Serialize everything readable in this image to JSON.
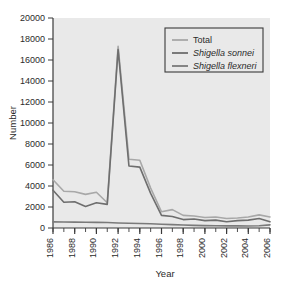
{
  "chart_data": {
    "type": "line",
    "title": "",
    "xlabel": "Year",
    "ylabel": "Number",
    "xlim": [
      1986,
      2006
    ],
    "ylim": [
      0,
      20000
    ],
    "grid": false,
    "legend_position": "top-right",
    "x": [
      1986,
      1987,
      1988,
      1989,
      1990,
      1991,
      1992,
      1993,
      1994,
      1995,
      1996,
      1997,
      1998,
      1999,
      2000,
      2001,
      2002,
      2003,
      2004,
      2005,
      2006
    ],
    "xticklabels": [
      "1986",
      "1988",
      "1990",
      "1992",
      "1994",
      "1996",
      "1998",
      "2000",
      "2002",
      "2004",
      "2006"
    ],
    "xtickvalues": [
      1986,
      1988,
      1990,
      1992,
      1994,
      1996,
      1998,
      2000,
      2002,
      2004,
      2006
    ],
    "yticklabels": [
      "0",
      "2000",
      "4000",
      "6000",
      "8000",
      "10000",
      "12000",
      "14000",
      "16000",
      "18000",
      "20000"
    ],
    "ytickvalues": [
      0,
      2000,
      4000,
      6000,
      8000,
      10000,
      12000,
      14000,
      16000,
      18000,
      20000
    ],
    "series": [
      {
        "name": "Total",
        "italic": false,
        "color": "#a8a8a8",
        "values": [
          4600,
          3500,
          3450,
          3200,
          3400,
          2400,
          17300,
          6550,
          6450,
          3800,
          1550,
          1750,
          1200,
          1150,
          1000,
          1050,
          900,
          950,
          1050,
          1250,
          1050
        ]
      },
      {
        "name": "Shigella sonnei",
        "italic": true,
        "color": "#6e6e6e",
        "values": [
          3600,
          2450,
          2500,
          2050,
          2400,
          2250,
          17000,
          5900,
          5800,
          3300,
          1200,
          1100,
          800,
          850,
          700,
          750,
          600,
          700,
          750,
          900,
          600
        ]
      },
      {
        "name": "Shigella flexneri",
        "italic": true,
        "color": "#7a7a7a",
        "values": [
          580,
          570,
          560,
          550,
          540,
          520,
          480,
          450,
          430,
          400,
          350,
          320,
          280,
          250,
          230,
          220,
          200,
          200,
          190,
          210,
          300
        ]
      }
    ]
  },
  "legend": {
    "items": [
      {
        "label": "Total"
      },
      {
        "label": "Shigella sonnei"
      },
      {
        "label": "Shigella flexneri"
      }
    ]
  },
  "axes": {
    "y_title": "Number",
    "x_title": "Year"
  },
  "colors": {
    "plot_background": "#e9e9e9",
    "figure_background": "#ffffff",
    "axis": "#3a3a3a",
    "legend_border": "#3a3a3a",
    "total": "#a8a8a8",
    "sonnei": "#6e6e6e",
    "flexneri": "#7a7a7a"
  }
}
